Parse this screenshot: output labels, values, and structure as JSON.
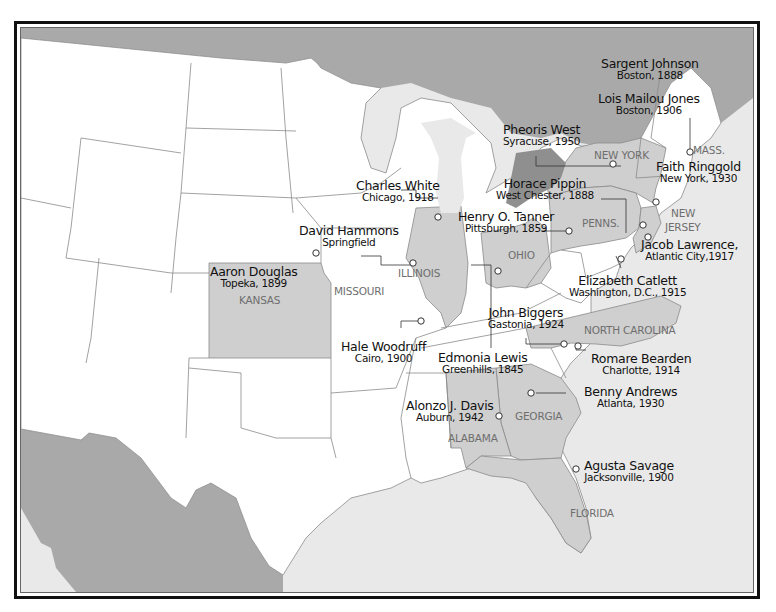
{
  "colors": {
    "foreign_land": "#a9a9a9",
    "water": "#e9e9e9",
    "us_land": "#ffffff",
    "highlight_state": "#cfcfcf",
    "dark_state": "#8f8f8f",
    "border": "#8a8a8a",
    "text": "#111111",
    "state_label": "#6e6e6e"
  },
  "state_labels": [
    {
      "id": "new-york",
      "text": "NEW YORK"
    },
    {
      "id": "mass",
      "text": "MASS."
    },
    {
      "id": "penns",
      "text": "PENNS."
    },
    {
      "id": "new-jersey-1",
      "text": "NEW"
    },
    {
      "id": "new-jersey-2",
      "text": "JERSEY"
    },
    {
      "id": "ohio",
      "text": "OHIO"
    },
    {
      "id": "illinois",
      "text": "ILLINOIS"
    },
    {
      "id": "missouri",
      "text": "MISSOURI"
    },
    {
      "id": "kansas",
      "text": "KANSAS"
    },
    {
      "id": "north-carolina",
      "text": "NORTH CAROLINA"
    },
    {
      "id": "georgia",
      "text": "GEORGIA"
    },
    {
      "id": "alabama",
      "text": "ALABAMA"
    },
    {
      "id": "florida",
      "text": "FLORIDA"
    }
  ],
  "artists": [
    {
      "name": "Sargent Johnson",
      "place": "Boston, 1888"
    },
    {
      "name": "Lois Mailou Jones",
      "place": "Boston, 1906"
    },
    {
      "name": "Pheoris West",
      "place": "Syracuse, 1950"
    },
    {
      "name": "Faith Ringgold",
      "place": "New York, 1930"
    },
    {
      "name": "Horace Pippin",
      "place": "West Chester, 1888"
    },
    {
      "name": "Charles White",
      "place": "Chicago, 1918"
    },
    {
      "name": "Henry O. Tanner",
      "place": "Pittsburgh, 1859"
    },
    {
      "name": "David Hammons",
      "place": "Springfield"
    },
    {
      "name": "Jacob Lawrence,",
      "place": "Atlantic City,1917"
    },
    {
      "name": "Aaron Douglas",
      "place": "Topeka, 1899"
    },
    {
      "name": "Elizabeth Catlett",
      "place": "Washington, D.C., 1915"
    },
    {
      "name": "John Biggers",
      "place": "Gastonia, 1924"
    },
    {
      "name": "Hale Woodruff",
      "place": "Cairo, 1900"
    },
    {
      "name": "Edmonia Lewis",
      "place": "Greenhills, 1845"
    },
    {
      "name": "Romare Bearden",
      "place": "Charlotte, 1914"
    },
    {
      "name": "Benny Andrews",
      "place": "Atlanta, 1930"
    },
    {
      "name": "Alonzo J. Davis",
      "place": "Auburn, 1942"
    },
    {
      "name": "Agusta Savage",
      "place": "Jacksonville, 1900"
    }
  ]
}
